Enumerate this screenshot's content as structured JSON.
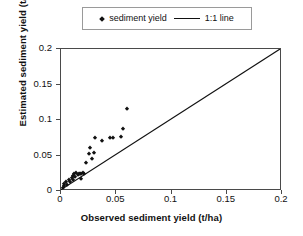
{
  "legend": {
    "position": "top-center",
    "entries": [
      {
        "label": "sediment yield",
        "marker": "diamond-marker-icon",
        "color": "#111111"
      },
      {
        "label": "1:1 line",
        "marker": "line-swatch-icon",
        "color": "#111111"
      }
    ]
  },
  "axes": {
    "x": {
      "title": "Observed sediment yield (t/ha)",
      "ticks": [
        "0",
        "0.05",
        "0.1",
        "0.15",
        "0.2"
      ],
      "min": 0,
      "max": 0.2
    },
    "y": {
      "title": "Estimated sediment yield (t/ha)",
      "ticks": [
        "0",
        "0.05",
        "0.1",
        "0.15",
        "0.2"
      ],
      "min": 0,
      "max": 0.2
    }
  },
  "chart_data": {
    "type": "scatter",
    "title": "",
    "xlabel": "Observed sediment yield (t/ha)",
    "ylabel": "Estimated sediment yield (t/ha)",
    "xlim": [
      0,
      0.2
    ],
    "ylim": [
      0,
      0.2
    ],
    "xticks": [
      0,
      0.05,
      0.1,
      0.15,
      0.2
    ],
    "yticks": [
      0,
      0.05,
      0.1,
      0.15,
      0.2
    ],
    "grid": false,
    "legend_position": "top-center",
    "series": [
      {
        "name": "sediment yield",
        "type": "scatter",
        "marker": "diamond",
        "color": "#111111",
        "points": [
          [
            0.002,
            0.004
          ],
          [
            0.0025,
            0.007
          ],
          [
            0.003,
            0.01
          ],
          [
            0.0045,
            0.013
          ],
          [
            0.005,
            0.0085
          ],
          [
            0.007,
            0.015
          ],
          [
            0.008,
            0.012
          ],
          [
            0.0095,
            0.018
          ],
          [
            0.0105,
            0.0215
          ],
          [
            0.011,
            0.016
          ],
          [
            0.012,
            0.0235
          ],
          [
            0.013,
            0.0195
          ],
          [
            0.014,
            0.025
          ],
          [
            0.015,
            0.0225
          ],
          [
            0.016,
            0.024
          ],
          [
            0.017,
            0.0245
          ],
          [
            0.018,
            0.0235
          ],
          [
            0.0185,
            0.0175
          ],
          [
            0.0195,
            0.025
          ],
          [
            0.0205,
            0.0245
          ],
          [
            0.0225,
            0.039
          ],
          [
            0.025,
            0.052
          ],
          [
            0.0265,
            0.06
          ],
          [
            0.028,
            0.045
          ],
          [
            0.0295,
            0.054
          ],
          [
            0.031,
            0.0745
          ],
          [
            0.0375,
            0.07
          ],
          [
            0.0445,
            0.074
          ],
          [
            0.0475,
            0.0745
          ],
          [
            0.0545,
            0.076
          ],
          [
            0.056,
            0.087
          ],
          [
            0.0595,
            0.115
          ]
        ]
      },
      {
        "name": "1:1 line",
        "type": "line",
        "color": "#111111",
        "points": [
          [
            0,
            0
          ],
          [
            0.2,
            0.2
          ]
        ]
      }
    ]
  }
}
